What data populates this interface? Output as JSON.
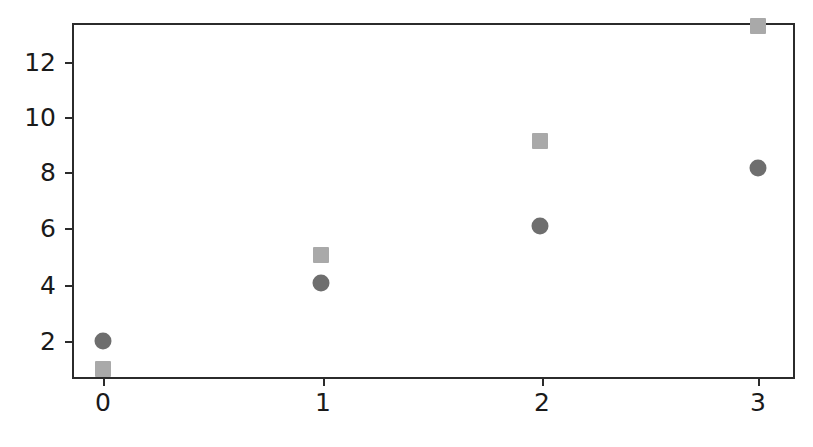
{
  "chart_data": {
    "type": "scatter",
    "title": "",
    "xlabel": "",
    "ylabel": "",
    "xlim": [
      -0.47,
      3.15
    ],
    "ylim": [
      0.13,
      13.83
    ],
    "grid": false,
    "legend": "none",
    "xticks": [
      0,
      1,
      2,
      3
    ],
    "xticklabels": [
      "0",
      "1",
      "2",
      "3"
    ],
    "yticks": [
      2,
      4,
      6,
      8,
      10,
      12
    ],
    "yticklabels": [
      "2",
      "4",
      "6",
      "8",
      "10",
      "12"
    ],
    "x": [
      0,
      1,
      2,
      3
    ],
    "series": [
      {
        "name": "circles",
        "marker": "circle",
        "color": "#6e6e6e",
        "size": 17,
        "values": [
          2.0,
          4.05,
          6.1,
          8.15
        ]
      },
      {
        "name": "squares",
        "marker": "square",
        "color": "#a9a9a9",
        "size": 16,
        "values": [
          1.0,
          5.05,
          9.1,
          13.2
        ]
      }
    ]
  },
  "axes": {
    "spine_color": "#2b2b2b",
    "background": "#ffffff"
  }
}
